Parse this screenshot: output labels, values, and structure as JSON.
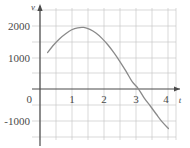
{
  "chart_data": {
    "type": "line",
    "title": "",
    "subtitle": "",
    "xlabel": "t",
    "ylabel": "v",
    "xlim": [
      -0.25,
      4.25
    ],
    "ylim": [
      -1500,
      2500
    ],
    "xticks": [
      0,
      1,
      2,
      3,
      4
    ],
    "xtick_labels": [
      "0",
      "1",
      "2",
      "3",
      "4"
    ],
    "yticks": [
      -1000,
      0,
      1000,
      2000
    ],
    "ytick_labels": [
      "-1000",
      "0",
      "1000",
      "2000"
    ],
    "grid": true,
    "grid_color": "#c9c9c9",
    "legend": null,
    "annotations": [],
    "series": [
      {
        "name": "v(t)",
        "color": "#8a8a8a",
        "x": [
          0.0,
          0.2,
          0.4,
          0.6,
          0.8,
          1.0,
          1.2,
          1.4,
          1.6,
          1.8,
          2.0,
          2.2,
          2.4,
          2.6,
          2.8,
          3.0,
          3.2,
          3.4,
          3.6,
          3.8,
          4.0
        ],
        "y": [
          1150,
          1380,
          1570,
          1720,
          1840,
          1900,
          1910,
          1850,
          1740,
          1580,
          1380,
          1140,
          870,
          580,
          270,
          60,
          -230,
          -470,
          -720,
          -960,
          -1150
        ]
      }
    ],
    "zero_crossings": [
      3.05
    ],
    "peak": {
      "x": 1.2,
      "y": 1910
    }
  },
  "labels": {
    "y_axis_label": "v",
    "x_axis_label": "t",
    "y_2000": "2000",
    "y_1000": "1000",
    "y_0": "0",
    "y_neg1000": "-1000",
    "x_1": "1",
    "x_2": "2",
    "x_3": "3",
    "x_4": "4"
  },
  "colors": {
    "curve": "#8a8a8a",
    "axis": "#4a4a4a",
    "grid": "#c9c9c9",
    "background": "#ffffff",
    "text": "#4a4a4a"
  }
}
